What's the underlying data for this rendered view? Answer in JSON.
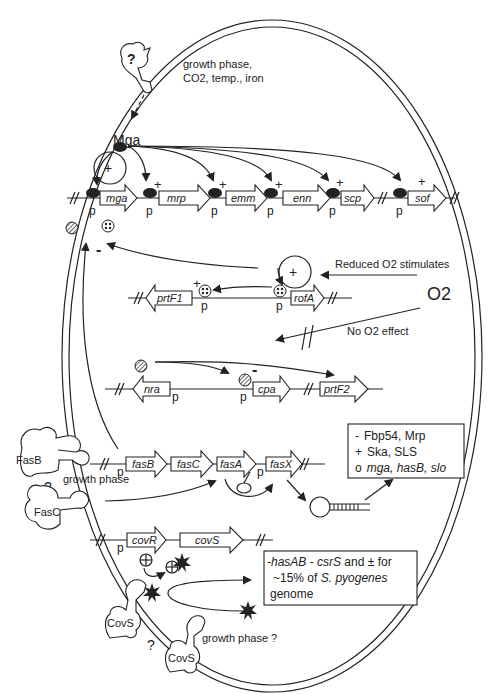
{
  "diagram": {
    "signals": {
      "top": [
        "growth phase,",
        "CO2, temp., iron"
      ],
      "unknown_receptor": "?",
      "reduced_o2": "Reduced O2 stimulates",
      "o2": "O2",
      "no_o2_effect": "No O2 effect",
      "fas_growth_phase": "growth phase",
      "cov_growth_phase": "growth phase ?",
      "fas_question": "?",
      "cov_question": "?"
    },
    "regulators": {
      "mga": "Mga",
      "fasB": "FasB",
      "fasC": "FasC",
      "covS_1": "CovS",
      "covS_2": "CovS"
    },
    "signs": {
      "plus": "+",
      "minus": "-",
      "promoter": "p"
    },
    "operons": {
      "mga": [
        "mga",
        "mrp",
        "emm",
        "enn",
        "scp",
        "sof"
      ],
      "rofA": [
        "prtF1",
        "rofA"
      ],
      "nra": [
        "nra",
        "cpa",
        "prtF2"
      ],
      "fas": [
        "fasB",
        "fasC",
        "fasA",
        "fasX"
      ],
      "cov": [
        "covR",
        "covS"
      ]
    },
    "fas_targets": [
      {
        "sign": "-",
        "text": "Fbp54, Mrp",
        "italic": false
      },
      {
        "sign": "+",
        "text": "Ska, SLS",
        "italic": false
      },
      {
        "sign": "o",
        "text": "mga, hasB, slo",
        "italic": true
      }
    ],
    "cov_targets": {
      "line1_a": "-hasAB",
      "line1_b": " - ",
      "line1_c": "csrS",
      "line1_d": " and  ± for",
      "line2_a": "~15% of ",
      "line2_b": "S. pyogenes",
      "line3": "genome"
    }
  }
}
